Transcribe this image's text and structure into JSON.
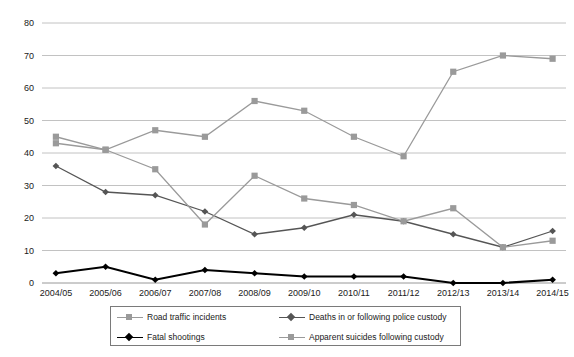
{
  "chart_data": {
    "type": "line",
    "title": "",
    "subtitle": "",
    "xlabel": "",
    "ylabel": "",
    "grid": true,
    "legend_position": "bottom",
    "ylim": [
      0,
      80
    ],
    "y_ticks": [
      0,
      10,
      20,
      30,
      40,
      50,
      60,
      70,
      80
    ],
    "categories": [
      "2004/05",
      "2005/06",
      "2006/07",
      "2007/08",
      "2008/09",
      "2009/10",
      "2010/11",
      "2011/12",
      "2012/13",
      "2013/14",
      "2014/15"
    ],
    "series": [
      {
        "name": "Road traffic incidents",
        "color": "#9a9a9a",
        "marker": "square",
        "values": [
          43,
          41,
          47,
          45,
          56,
          53,
          45,
          39,
          65,
          70,
          69
        ]
      },
      {
        "name": "Deaths in or following police custody",
        "color": "#555555",
        "marker": "diamond",
        "values": [
          36,
          28,
          27,
          22,
          15,
          17,
          21,
          19,
          15,
          11,
          16
        ]
      },
      {
        "name": "Fatal shootings",
        "color": "#000000",
        "marker": "diamond",
        "values": [
          3,
          5,
          1,
          4,
          3,
          2,
          2,
          2,
          0,
          0,
          1
        ]
      },
      {
        "name": "Apparent suicides following custody",
        "color": "#9a9a9a",
        "marker": "square",
        "values": [
          45,
          41,
          35,
          18,
          33,
          26,
          24,
          19,
          23,
          11,
          13
        ]
      }
    ]
  },
  "legend": {
    "entries": [
      {
        "label": "Road traffic incidents",
        "color": "#9a9a9a",
        "marker": "square"
      },
      {
        "label": "Deaths in or following police custody",
        "color": "#555555",
        "marker": "diamond"
      },
      {
        "label": "Fatal shootings",
        "color": "#000000",
        "marker": "diamond"
      },
      {
        "label": "Apparent suicides following custody",
        "color": "#9a9a9a",
        "marker": "square"
      }
    ]
  },
  "axes": {
    "y_tick_labels": [
      "0",
      "10",
      "20",
      "30",
      "40",
      "50",
      "60",
      "70",
      "80"
    ],
    "x_tick_labels": [
      "2004/05",
      "2005/06",
      "2006/07",
      "2007/08",
      "2008/09",
      "2009/10",
      "2010/11",
      "2011/12",
      "2012/13",
      "2013/14",
      "2014/15"
    ]
  }
}
